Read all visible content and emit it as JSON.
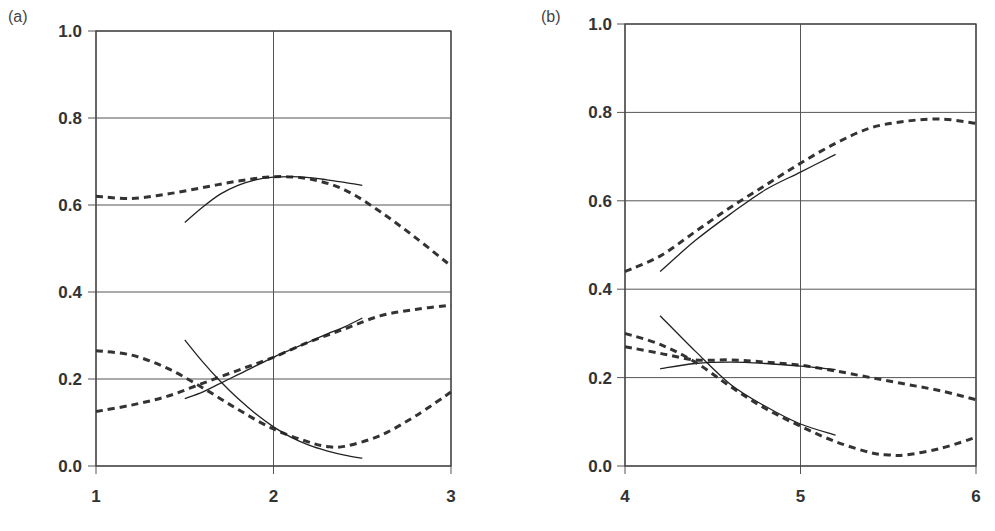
{
  "chart_data": [
    {
      "type": "line",
      "panel_label": "(a)",
      "title": "",
      "xlabel": "",
      "ylabel": "",
      "xlim": [
        1,
        3
      ],
      "ylim": [
        0.0,
        1.0
      ],
      "x_ticks": [
        "1",
        "2",
        "3"
      ],
      "y_ticks": [
        "0.0",
        "0.2",
        "0.4",
        "0.6",
        "0.8",
        "1.0"
      ],
      "grid": true,
      "legend": null,
      "series": [
        {
          "name": "dashed-upper",
          "style": "dashed",
          "x": [
            1.0,
            1.2,
            1.4,
            1.6,
            1.8,
            2.0,
            2.2,
            2.4,
            2.6,
            2.8,
            3.0
          ],
          "y": [
            0.62,
            0.615,
            0.625,
            0.64,
            0.655,
            0.665,
            0.66,
            0.635,
            0.585,
            0.525,
            0.46
          ]
        },
        {
          "name": "solid-upper",
          "style": "solid",
          "x": [
            1.5,
            1.6,
            1.7,
            1.8,
            1.9,
            2.0,
            2.1,
            2.2,
            2.3,
            2.4,
            2.5
          ],
          "y": [
            0.56,
            0.595,
            0.625,
            0.645,
            0.658,
            0.664,
            0.665,
            0.663,
            0.658,
            0.652,
            0.645
          ]
        },
        {
          "name": "dashed-rising",
          "style": "dashed",
          "x": [
            1.0,
            1.2,
            1.4,
            1.6,
            1.8,
            2.0,
            2.2,
            2.4,
            2.6,
            2.8,
            3.0
          ],
          "y": [
            0.125,
            0.14,
            0.16,
            0.19,
            0.22,
            0.25,
            0.285,
            0.315,
            0.345,
            0.36,
            0.37
          ]
        },
        {
          "name": "solid-rising",
          "style": "solid",
          "x": [
            1.5,
            1.6,
            1.7,
            1.8,
            1.9,
            2.0,
            2.1,
            2.2,
            2.3,
            2.4,
            2.5
          ],
          "y": [
            0.155,
            0.17,
            0.19,
            0.21,
            0.23,
            0.25,
            0.268,
            0.285,
            0.303,
            0.32,
            0.34
          ]
        },
        {
          "name": "dashed-falling",
          "style": "dashed",
          "x": [
            1.0,
            1.2,
            1.4,
            1.6,
            1.8,
            2.0,
            2.2,
            2.3,
            2.4,
            2.6,
            2.8,
            3.0
          ],
          "y": [
            0.265,
            0.255,
            0.225,
            0.18,
            0.13,
            0.085,
            0.055,
            0.045,
            0.045,
            0.07,
            0.115,
            0.17
          ]
        },
        {
          "name": "solid-falling",
          "style": "solid",
          "x": [
            1.5,
            1.6,
            1.7,
            1.8,
            1.9,
            2.0,
            2.1,
            2.2,
            2.3,
            2.4,
            2.5
          ],
          "y": [
            0.29,
            0.24,
            0.195,
            0.155,
            0.12,
            0.09,
            0.066,
            0.048,
            0.035,
            0.025,
            0.018
          ]
        }
      ]
    },
    {
      "type": "line",
      "panel_label": "(b)",
      "title": "",
      "xlabel": "",
      "ylabel": "",
      "xlim": [
        4,
        6
      ],
      "ylim": [
        0.0,
        1.0
      ],
      "x_ticks": [
        "4",
        "5",
        "6"
      ],
      "y_ticks": [
        "0.0",
        "0.2",
        "0.4",
        "0.6",
        "0.8",
        "1.0"
      ],
      "grid": true,
      "legend": null,
      "series": [
        {
          "name": "dashed-upper",
          "style": "dashed",
          "x": [
            4.0,
            4.2,
            4.4,
            4.6,
            4.8,
            5.0,
            5.2,
            5.4,
            5.6,
            5.8,
            6.0
          ],
          "y": [
            0.44,
            0.475,
            0.53,
            0.585,
            0.635,
            0.685,
            0.73,
            0.765,
            0.78,
            0.785,
            0.775
          ]
        },
        {
          "name": "solid-upper",
          "style": "solid",
          "x": [
            4.2,
            4.4,
            4.6,
            4.8,
            5.0,
            5.2
          ],
          "y": [
            0.44,
            0.51,
            0.57,
            0.625,
            0.665,
            0.705
          ]
        },
        {
          "name": "dashed-flat",
          "style": "dashed",
          "x": [
            4.0,
            4.2,
            4.4,
            4.6,
            4.8,
            5.0,
            5.2,
            5.4,
            5.6,
            5.8,
            6.0
          ],
          "y": [
            0.27,
            0.255,
            0.24,
            0.24,
            0.235,
            0.228,
            0.215,
            0.2,
            0.185,
            0.17,
            0.15
          ]
        },
        {
          "name": "solid-flat",
          "style": "solid",
          "x": [
            4.2,
            4.4,
            4.6,
            4.8,
            5.0,
            5.2
          ],
          "y": [
            0.22,
            0.232,
            0.235,
            0.232,
            0.226,
            0.218
          ]
        },
        {
          "name": "dashed-falling",
          "style": "dashed",
          "x": [
            4.0,
            4.2,
            4.4,
            4.6,
            4.8,
            5.0,
            5.2,
            5.4,
            5.5,
            5.6,
            5.8,
            6.0
          ],
          "y": [
            0.3,
            0.275,
            0.235,
            0.18,
            0.13,
            0.09,
            0.055,
            0.03,
            0.025,
            0.025,
            0.04,
            0.065
          ]
        },
        {
          "name": "solid-falling",
          "style": "solid",
          "x": [
            4.2,
            4.4,
            4.6,
            4.8,
            5.0,
            5.2
          ],
          "y": [
            0.34,
            0.26,
            0.185,
            0.135,
            0.095,
            0.07
          ]
        }
      ]
    }
  ]
}
